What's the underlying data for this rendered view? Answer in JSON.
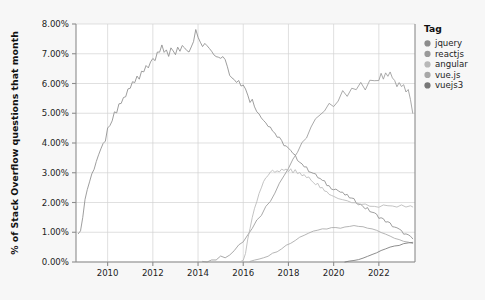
{
  "chart_data": {
    "type": "line",
    "title": "",
    "xlabel": "",
    "ylabel": "% of Stack Overflow questions that month",
    "xlim": [
      2008.6,
      2023.6
    ],
    "ylim": [
      0.0,
      8.0
    ],
    "grid": true,
    "legend_position": "right",
    "legend_title": "Tag",
    "y_tick_labels": [
      "0.00%",
      "1.00%",
      "2.00%",
      "3.00%",
      "4.00%",
      "5.00%",
      "6.00%",
      "7.00%",
      "8.00%"
    ],
    "y_tick_values": [
      0,
      1,
      2,
      3,
      4,
      5,
      6,
      7,
      8
    ],
    "x_tick_labels": [
      "2010",
      "2012",
      "2014",
      "2016",
      "2018",
      "2020",
      "2022"
    ],
    "x_tick_values": [
      2010,
      2012,
      2014,
      2016,
      2018,
      2020,
      2022
    ],
    "series": [
      {
        "name": "jquery",
        "color": "#8c8c8c",
        "x": [
          2008.7,
          2008.8,
          2008.9,
          2009.0,
          2009.1,
          2009.2,
          2009.3,
          2009.4,
          2009.5,
          2009.6,
          2009.7,
          2009.8,
          2009.9,
          2010.0,
          2010.1,
          2010.2,
          2010.3,
          2010.4,
          2010.5,
          2010.6,
          2010.7,
          2010.8,
          2010.9,
          2011.0,
          2011.1,
          2011.2,
          2011.3,
          2011.4,
          2011.5,
          2011.6,
          2011.7,
          2011.8,
          2011.9,
          2012.0,
          2012.1,
          2012.2,
          2012.3,
          2012.4,
          2012.5,
          2012.6,
          2012.7,
          2012.8,
          2012.9,
          2013.0,
          2013.1,
          2013.2,
          2013.3,
          2013.4,
          2013.5,
          2013.6,
          2013.7,
          2013.8,
          2013.9,
          2014.0,
          2014.1,
          2014.2,
          2014.3,
          2014.4,
          2014.5,
          2014.6,
          2014.7,
          2014.8,
          2014.9,
          2015.0,
          2015.1,
          2015.2,
          2015.3,
          2015.4,
          2015.5,
          2015.6,
          2015.7,
          2015.8,
          2015.9,
          2016.0,
          2016.1,
          2016.2,
          2016.3,
          2016.4,
          2016.5,
          2016.6,
          2016.7,
          2016.8,
          2016.9,
          2017.0,
          2017.1,
          2017.2,
          2017.3,
          2017.4,
          2017.5,
          2017.6,
          2017.7,
          2017.8,
          2017.9,
          2018.0,
          2018.1,
          2018.2,
          2018.3,
          2018.4,
          2018.5,
          2018.6,
          2018.7,
          2018.8,
          2018.9,
          2019.0,
          2019.1,
          2019.2,
          2019.3,
          2019.4,
          2019.5,
          2019.6,
          2019.7,
          2019.8,
          2019.9,
          2020.0,
          2020.1,
          2020.2,
          2020.3,
          2020.4,
          2020.5,
          2020.6,
          2020.7,
          2020.8,
          2020.9,
          2021.0,
          2021.1,
          2021.2,
          2021.3,
          2021.4,
          2021.5,
          2021.6,
          2021.7,
          2021.8,
          2021.9,
          2022.0,
          2022.1,
          2022.2,
          2022.3,
          2022.4,
          2022.5,
          2022.6,
          2022.7,
          2022.8,
          2022.9,
          2023.0,
          2023.1,
          2023.2,
          2023.3,
          2023.4,
          2023.5
        ],
        "y": [
          0.95,
          1.0,
          1.55,
          2.1,
          2.45,
          2.7,
          2.95,
          3.15,
          3.4,
          3.6,
          3.75,
          3.95,
          4.1,
          4.45,
          4.55,
          4.75,
          5.0,
          5.02,
          5.3,
          5.35,
          5.5,
          5.55,
          5.8,
          5.85,
          6.1,
          6.05,
          6.25,
          6.2,
          6.45,
          6.4,
          6.55,
          6.5,
          6.75,
          6.85,
          6.8,
          7.05,
          7.0,
          7.25,
          7.05,
          7.1,
          6.9,
          7.15,
          7.1,
          7.0,
          7.2,
          7.05,
          7.3,
          7.2,
          7.15,
          7.1,
          7.25,
          7.45,
          7.78,
          7.55,
          7.4,
          7.2,
          7.35,
          7.3,
          7.2,
          7.12,
          7.0,
          6.95,
          6.85,
          6.9,
          6.95,
          6.85,
          6.55,
          6.3,
          6.2,
          6.15,
          6.05,
          6.1,
          5.95,
          6.0,
          5.85,
          5.6,
          5.4,
          5.45,
          5.25,
          5.1,
          4.95,
          4.85,
          4.8,
          4.7,
          4.6,
          4.55,
          4.4,
          4.35,
          4.2,
          4.15,
          4.05,
          3.95,
          3.9,
          3.8,
          3.72,
          3.62,
          3.55,
          3.45,
          3.4,
          3.3,
          3.22,
          3.15,
          3.08,
          3.05,
          2.98,
          2.92,
          2.85,
          2.8,
          2.72,
          2.68,
          2.6,
          2.55,
          2.5,
          2.48,
          2.45,
          2.4,
          2.35,
          2.3,
          2.26,
          2.22,
          2.18,
          2.12,
          2.08,
          2.02,
          1.98,
          1.92,
          1.88,
          1.82,
          1.78,
          1.72,
          1.68,
          1.62,
          1.58,
          1.52,
          1.48,
          1.42,
          1.38,
          1.32,
          1.28,
          1.22,
          1.18,
          1.12,
          1.08,
          1.02,
          0.98,
          0.92,
          0.88,
          0.82,
          0.78
        ]
      },
      {
        "name": "reactjs",
        "color": "#9a9a9a",
        "x": [
          2014.2,
          2014.4,
          2014.6,
          2014.8,
          2015.0,
          2015.2,
          2015.4,
          2015.6,
          2015.8,
          2016.0,
          2016.2,
          2016.4,
          2016.6,
          2016.8,
          2017.0,
          2017.2,
          2017.4,
          2017.6,
          2017.8,
          2018.0,
          2018.2,
          2018.4,
          2018.6,
          2018.8,
          2019.0,
          2019.2,
          2019.4,
          2019.6,
          2019.8,
          2020.0,
          2020.2,
          2020.4,
          2020.6,
          2020.8,
          2021.0,
          2021.2,
          2021.4,
          2021.6,
          2021.8,
          2022.0,
          2022.1,
          2022.2,
          2022.3,
          2022.4,
          2022.5,
          2022.6,
          2022.7,
          2022.8,
          2022.9,
          2023.0,
          2023.1,
          2023.2,
          2023.3,
          2023.4,
          2023.5
        ],
        "y": [
          0.02,
          0.04,
          0.07,
          0.1,
          0.14,
          0.2,
          0.28,
          0.38,
          0.52,
          0.7,
          0.9,
          1.1,
          1.35,
          1.6,
          1.85,
          2.1,
          2.38,
          2.65,
          2.9,
          3.15,
          3.4,
          3.7,
          3.95,
          4.2,
          4.5,
          4.75,
          5.0,
          5.15,
          5.3,
          5.25,
          5.45,
          5.7,
          5.6,
          5.85,
          5.75,
          6.0,
          5.85,
          6.1,
          6.05,
          6.15,
          6.3,
          6.1,
          6.4,
          6.25,
          6.35,
          6.15,
          6.05,
          5.95,
          6.0,
          5.85,
          5.9,
          5.7,
          5.8,
          5.4,
          5.0
        ]
      },
      {
        "name": "angular",
        "color": "#b8b8b8",
        "x": [
          2015.9,
          2016.0,
          2016.1,
          2016.2,
          2016.3,
          2016.4,
          2016.5,
          2016.6,
          2016.7,
          2016.8,
          2016.9,
          2017.0,
          2017.1,
          2017.2,
          2017.3,
          2017.4,
          2017.5,
          2017.6,
          2017.7,
          2017.8,
          2017.9,
          2018.0,
          2018.1,
          2018.2,
          2018.3,
          2018.4,
          2018.5,
          2018.6,
          2018.7,
          2018.8,
          2018.9,
          2019.0,
          2019.1,
          2019.2,
          2019.3,
          2019.4,
          2019.5,
          2019.6,
          2019.7,
          2019.8,
          2019.9,
          2020.0,
          2020.2,
          2020.4,
          2020.6,
          2020.8,
          2021.0,
          2021.2,
          2021.4,
          2021.6,
          2021.8,
          2022.0,
          2022.2,
          2022.4,
          2022.6,
          2022.8,
          2023.0,
          2023.2,
          2023.4,
          2023.5
        ],
        "y": [
          0.02,
          0.05,
          0.3,
          0.75,
          1.15,
          1.5,
          1.8,
          2.05,
          2.3,
          2.5,
          2.68,
          2.82,
          2.92,
          3.0,
          3.05,
          3.02,
          3.08,
          3.05,
          3.1,
          3.06,
          3.12,
          3.05,
          3.1,
          3.02,
          3.08,
          2.98,
          3.0,
          2.9,
          2.95,
          2.82,
          2.86,
          2.75,
          2.7,
          2.6,
          2.62,
          2.5,
          2.48,
          2.38,
          2.35,
          2.28,
          2.25,
          2.2,
          2.15,
          2.1,
          2.05,
          2.0,
          1.98,
          1.92,
          1.95,
          1.9,
          1.88,
          1.85,
          1.9,
          1.86,
          1.88,
          1.84,
          1.9,
          1.86,
          1.88,
          1.85
        ]
      },
      {
        "name": "vue.js",
        "color": "#a8a8a8",
        "x": [
          2016.3,
          2016.5,
          2016.7,
          2016.9,
          2017.1,
          2017.3,
          2017.5,
          2017.7,
          2017.9,
          2018.1,
          2018.3,
          2018.5,
          2018.7,
          2018.9,
          2019.1,
          2019.3,
          2019.5,
          2019.7,
          2019.9,
          2020.1,
          2020.3,
          2020.5,
          2020.7,
          2020.9,
          2021.1,
          2021.3,
          2021.5,
          2021.7,
          2021.9,
          2022.1,
          2022.3,
          2022.5,
          2022.7,
          2022.9,
          2023.1,
          2023.3,
          2023.5
        ],
        "y": [
          0.02,
          0.05,
          0.09,
          0.14,
          0.2,
          0.28,
          0.36,
          0.45,
          0.55,
          0.64,
          0.73,
          0.82,
          0.9,
          0.97,
          1.03,
          1.08,
          1.12,
          1.1,
          1.14,
          1.16,
          1.13,
          1.18,
          1.2,
          1.22,
          1.18,
          1.2,
          1.15,
          1.1,
          1.05,
          0.98,
          0.92,
          0.86,
          0.8,
          0.75,
          0.7,
          0.66,
          0.62
        ]
      },
      {
        "name": "vuejs3",
        "color": "#787878",
        "x": [
          2020.5,
          2020.7,
          2020.9,
          2021.1,
          2021.3,
          2021.5,
          2021.7,
          2021.9,
          2022.1,
          2022.3,
          2022.5,
          2022.7,
          2022.9,
          2023.1,
          2023.3,
          2023.5
        ],
        "y": [
          0.0,
          0.02,
          0.05,
          0.09,
          0.14,
          0.2,
          0.26,
          0.32,
          0.38,
          0.44,
          0.49,
          0.53,
          0.57,
          0.61,
          0.64,
          0.66
        ]
      }
    ]
  },
  "legend": {
    "title": "Tag",
    "items": [
      {
        "label": "jquery",
        "color": "#8c8c8c"
      },
      {
        "label": "reactjs",
        "color": "#9a9a9a"
      },
      {
        "label": "angular",
        "color": "#b8b8b8"
      },
      {
        "label": "vue.js",
        "color": "#a8a8a8"
      },
      {
        "label": "vuejs3",
        "color": "#787878"
      }
    ]
  },
  "axes": {
    "y_title": "% of Stack Overflow questions that month"
  },
  "colors": {
    "page_background": "#f7f7f7",
    "plot_background": "#ffffff",
    "grid": "#d3d3d3",
    "axis": "#8c8c8c",
    "text": "#1d1d1d"
  }
}
